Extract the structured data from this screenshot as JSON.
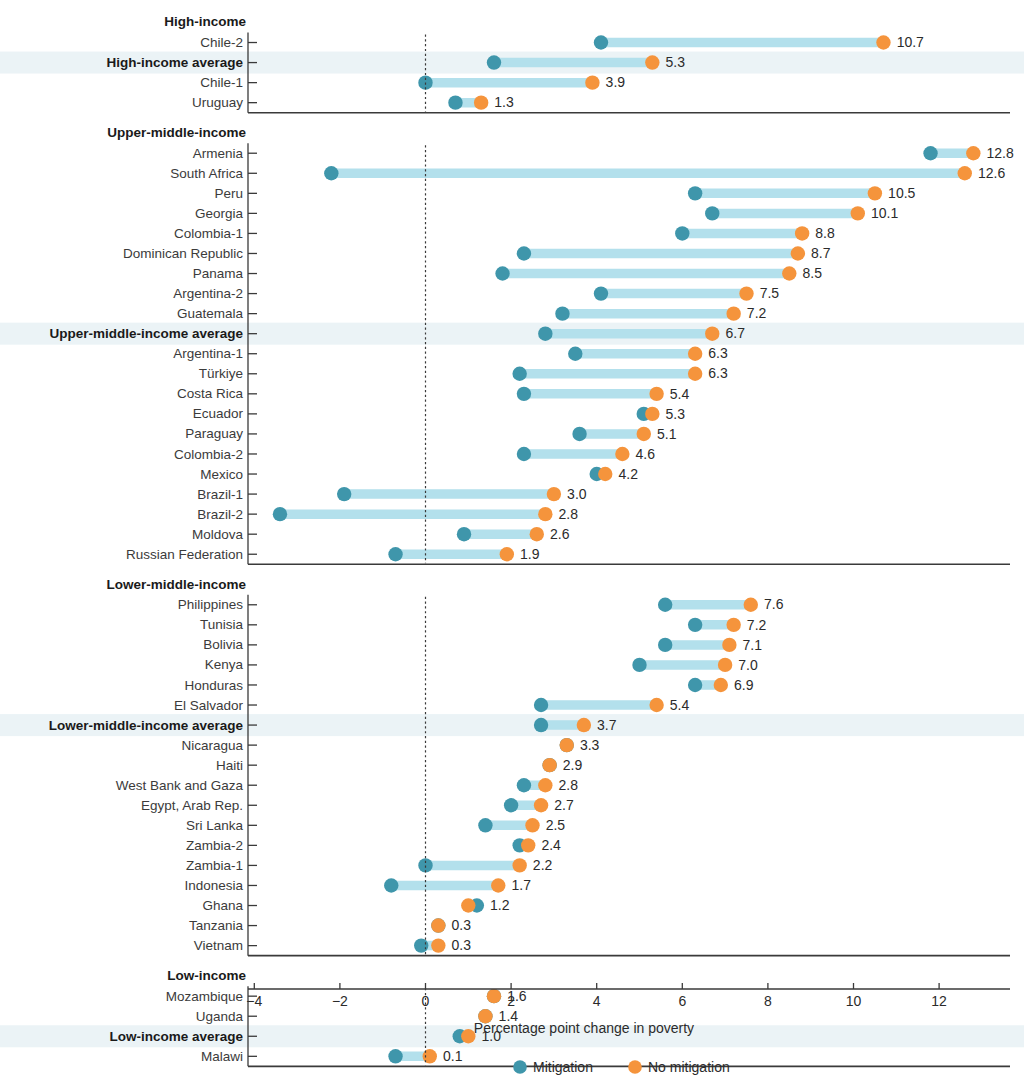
{
  "chart_data": {
    "type": "scatter",
    "subtype": "dumbbell",
    "title": "",
    "xlabel": "Percentage point change in poverty",
    "ylabel": "",
    "xlim": [
      -4.4,
      13.6
    ],
    "xticks": [
      -4,
      -2,
      0,
      2,
      4,
      6,
      8,
      10,
      12
    ],
    "xtick_labels": [
      "−4",
      "−2",
      "0",
      "2",
      "4",
      "6",
      "8",
      "10",
      "12"
    ],
    "grid": false,
    "zero_reference_line": 0,
    "legend": {
      "position": "bottom",
      "entries": [
        {
          "name": "Mitigation",
          "color": "#3f96ab"
        },
        {
          "name": "No mitigation",
          "color": "#f5943c"
        }
      ]
    },
    "series": [
      {
        "name": "Mitigation",
        "color": "#3f96ab"
      },
      {
        "name": "No mitigation",
        "color": "#f5943c"
      }
    ],
    "groups": [
      {
        "label": "High-income",
        "rows": [
          {
            "label": "Chile-2",
            "mitigation": 4.1,
            "no_mitigation": 10.7,
            "value_label": "10.7",
            "average": false
          },
          {
            "label": "High-income average",
            "mitigation": 1.6,
            "no_mitigation": 5.3,
            "value_label": "5.3",
            "average": true
          },
          {
            "label": "Chile-1",
            "mitigation": 0.0,
            "no_mitigation": 3.9,
            "value_label": "3.9",
            "average": false
          },
          {
            "label": "Uruguay",
            "mitigation": 0.7,
            "no_mitigation": 1.3,
            "value_label": "1.3",
            "average": false
          }
        ]
      },
      {
        "label": "Upper-middle-income",
        "rows": [
          {
            "label": "Armenia",
            "mitigation": 11.8,
            "no_mitigation": 12.8,
            "value_label": "12.8",
            "average": false
          },
          {
            "label": "South Africa",
            "mitigation": -2.2,
            "no_mitigation": 12.6,
            "value_label": "12.6",
            "average": false
          },
          {
            "label": "Peru",
            "mitigation": 6.3,
            "no_mitigation": 10.5,
            "value_label": "10.5",
            "average": false
          },
          {
            "label": "Georgia",
            "mitigation": 6.7,
            "no_mitigation": 10.1,
            "value_label": "10.1",
            "average": false
          },
          {
            "label": "Colombia-1",
            "mitigation": 6.0,
            "no_mitigation": 8.8,
            "value_label": "8.8",
            "average": false
          },
          {
            "label": "Dominican Republic",
            "mitigation": 2.3,
            "no_mitigation": 8.7,
            "value_label": "8.7",
            "average": false
          },
          {
            "label": "Panama",
            "mitigation": 1.8,
            "no_mitigation": 8.5,
            "value_label": "8.5",
            "average": false
          },
          {
            "label": "Argentina-2",
            "mitigation": 4.1,
            "no_mitigation": 7.5,
            "value_label": "7.5",
            "average": false
          },
          {
            "label": "Guatemala",
            "mitigation": 3.2,
            "no_mitigation": 7.2,
            "value_label": "7.2",
            "average": false
          },
          {
            "label": "Upper-middle-income average",
            "mitigation": 2.8,
            "no_mitigation": 6.7,
            "value_label": "6.7",
            "average": true
          },
          {
            "label": "Argentina-1",
            "mitigation": 3.5,
            "no_mitigation": 6.3,
            "value_label": "6.3",
            "average": false
          },
          {
            "label": "Türkiye",
            "mitigation": 2.2,
            "no_mitigation": 6.3,
            "value_label": "6.3",
            "average": false
          },
          {
            "label": "Costa Rica",
            "mitigation": 2.3,
            "no_mitigation": 5.4,
            "value_label": "5.4",
            "average": false
          },
          {
            "label": "Ecuador",
            "mitigation": 5.1,
            "no_mitigation": 5.3,
            "value_label": "5.3",
            "average": false
          },
          {
            "label": "Paraguay",
            "mitigation": 3.6,
            "no_mitigation": 5.1,
            "value_label": "5.1",
            "average": false
          },
          {
            "label": "Colombia-2",
            "mitigation": 2.3,
            "no_mitigation": 4.6,
            "value_label": "4.6",
            "average": false
          },
          {
            "label": "Mexico",
            "mitigation": 4.0,
            "no_mitigation": 4.2,
            "value_label": "4.2",
            "average": false
          },
          {
            "label": "Brazil-1",
            "mitigation": -1.9,
            "no_mitigation": 3.0,
            "value_label": "3.0",
            "average": false
          },
          {
            "label": "Brazil-2",
            "mitigation": -3.4,
            "no_mitigation": 2.8,
            "value_label": "2.8",
            "average": false
          },
          {
            "label": "Moldova",
            "mitigation": 0.9,
            "no_mitigation": 2.6,
            "value_label": "2.6",
            "average": false
          },
          {
            "label": "Russian Federation",
            "mitigation": -0.7,
            "no_mitigation": 1.9,
            "value_label": "1.9",
            "average": false
          }
        ]
      },
      {
        "label": "Lower-middle-income",
        "rows": [
          {
            "label": "Philippines",
            "mitigation": 5.6,
            "no_mitigation": 7.6,
            "value_label": "7.6",
            "average": false
          },
          {
            "label": "Tunisia",
            "mitigation": 6.3,
            "no_mitigation": 7.2,
            "value_label": "7.2",
            "average": false
          },
          {
            "label": "Bolivia",
            "mitigation": 5.6,
            "no_mitigation": 7.1,
            "value_label": "7.1",
            "average": false
          },
          {
            "label": "Kenya",
            "mitigation": 5.0,
            "no_mitigation": 7.0,
            "value_label": "7.0",
            "average": false
          },
          {
            "label": "Honduras",
            "mitigation": 6.3,
            "no_mitigation": 6.9,
            "value_label": "6.9",
            "average": false
          },
          {
            "label": "El Salvador",
            "mitigation": 2.7,
            "no_mitigation": 5.4,
            "value_label": "5.4",
            "average": false
          },
          {
            "label": "Lower-middle-income average",
            "mitigation": 2.7,
            "no_mitigation": 3.7,
            "value_label": "3.7",
            "average": true
          },
          {
            "label": "Nicaragua",
            "mitigation": 3.3,
            "no_mitigation": 3.3,
            "value_label": "3.3",
            "average": false
          },
          {
            "label": "Haiti",
            "mitigation": 2.9,
            "no_mitigation": 2.9,
            "value_label": "2.9",
            "average": false
          },
          {
            "label": "West Bank and Gaza",
            "mitigation": 2.3,
            "no_mitigation": 2.8,
            "value_label": "2.8",
            "average": false
          },
          {
            "label": "Egypt, Arab Rep.",
            "mitigation": 2.0,
            "no_mitigation": 2.7,
            "value_label": "2.7",
            "average": false
          },
          {
            "label": "Sri Lanka",
            "mitigation": 1.4,
            "no_mitigation": 2.5,
            "value_label": "2.5",
            "average": false
          },
          {
            "label": "Zambia-2",
            "mitigation": 2.2,
            "no_mitigation": 2.4,
            "value_label": "2.4",
            "average": false
          },
          {
            "label": "Zambia-1",
            "mitigation": 0.0,
            "no_mitigation": 2.2,
            "value_label": "2.2",
            "average": false
          },
          {
            "label": "Indonesia",
            "mitigation": -0.8,
            "no_mitigation": 1.7,
            "value_label": "1.7",
            "average": false
          },
          {
            "label": "Ghana",
            "mitigation": 1.2,
            "no_mitigation": 1.0,
            "value_label": "1.2",
            "average": false
          },
          {
            "label": "Tanzania",
            "mitigation": 0.3,
            "no_mitigation": 0.3,
            "value_label": "0.3",
            "average": false
          },
          {
            "label": "Vietnam",
            "mitigation": -0.1,
            "no_mitigation": 0.3,
            "value_label": "0.3",
            "average": false
          }
        ]
      },
      {
        "label": "Low-income",
        "rows": [
          {
            "label": "Mozambique",
            "mitigation": 1.6,
            "no_mitigation": 1.6,
            "value_label": "1.6",
            "average": false
          },
          {
            "label": "Uganda",
            "mitigation": 1.4,
            "no_mitigation": 1.4,
            "value_label": "1.4",
            "average": false
          },
          {
            "label": "Low-income average",
            "mitigation": 0.8,
            "no_mitigation": 1.0,
            "value_label": "1.0",
            "average": true
          },
          {
            "label": "Malawi",
            "mitigation": -0.7,
            "no_mitigation": 0.1,
            "value_label": "0.1",
            "average": false
          }
        ]
      }
    ]
  },
  "colors": {
    "mitigation": "#3f96ab",
    "no_mitigation": "#f5943c",
    "connector": "#b3e0ec",
    "average_band": "#e8f1f5",
    "axis": "#3a3a3a",
    "text": "#2b2b2b"
  }
}
